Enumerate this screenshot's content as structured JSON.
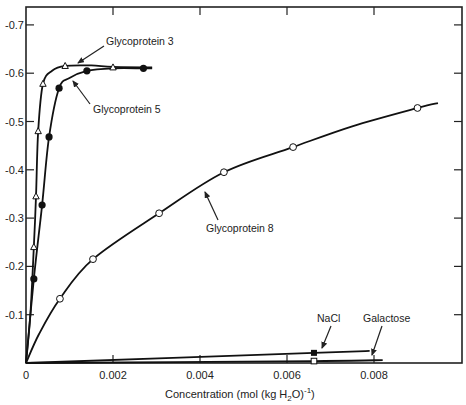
{
  "chart_data": {
    "type": "line",
    "title": "",
    "xlabel": "Concentration (mol (kg H2O)^-1)",
    "xlabel_parts": {
      "pre": "Concentration (mol (kg H",
      "sub": "2",
      "mid": "O)",
      "sup": "-1",
      "post": ")"
    },
    "ylabel": "",
    "xlim": [
      0,
      0.0099
    ],
    "ylim": [
      0,
      -0.74
    ],
    "x_ticks": [
      {
        "value": 0,
        "label": "0"
      },
      {
        "value": 0.002,
        "label": "0.002"
      },
      {
        "value": 0.004,
        "label": "0.004"
      },
      {
        "value": 0.006,
        "label": "0.006"
      },
      {
        "value": 0.008,
        "label": "0.008"
      }
    ],
    "y_ticks": [
      {
        "value": -0.1,
        "label": "-0.1"
      },
      {
        "value": -0.2,
        "label": "-0.2"
      },
      {
        "value": -0.3,
        "label": "-0.3"
      },
      {
        "value": -0.4,
        "label": "-0.4"
      },
      {
        "value": -0.5,
        "label": "-0.5"
      },
      {
        "value": -0.6,
        "label": "-0.6"
      },
      {
        "value": -0.7,
        "label": "-0.7"
      }
    ],
    "grid": false,
    "legend": "none (curves labeled with arrows)",
    "series": [
      {
        "name": "Glycoprotein 3",
        "marker": "open-triangle",
        "points": [
          [
            0.00018,
            -0.24
          ],
          [
            0.00023,
            -0.345
          ],
          [
            0.00028,
            -0.48
          ],
          [
            0.00039,
            -0.578
          ],
          [
            0.0009,
            -0.615
          ],
          [
            0.002,
            -0.612
          ]
        ],
        "curve": [
          [
            0,
            0
          ],
          [
            0.0001,
            -0.1
          ],
          [
            0.00018,
            -0.24
          ],
          [
            0.00023,
            -0.345
          ],
          [
            0.00028,
            -0.48
          ],
          [
            0.00039,
            -0.578
          ],
          [
            0.0006,
            -0.605
          ],
          [
            0.0009,
            -0.615
          ],
          [
            0.0015,
            -0.616
          ],
          [
            0.002,
            -0.613
          ],
          [
            0.0029,
            -0.612
          ]
        ]
      },
      {
        "name": "Glycoprotein 5",
        "marker": "filled-circle",
        "points": [
          [
            0.00018,
            -0.174
          ],
          [
            0.00037,
            -0.327
          ],
          [
            0.00053,
            -0.468
          ],
          [
            0.00076,
            -0.569
          ],
          [
            0.0014,
            -0.605
          ],
          [
            0.0027,
            -0.61
          ]
        ],
        "curve": [
          [
            0,
            0
          ],
          [
            0.00018,
            -0.174
          ],
          [
            0.00037,
            -0.327
          ],
          [
            0.00053,
            -0.468
          ],
          [
            0.00076,
            -0.569
          ],
          [
            0.001,
            -0.59
          ],
          [
            0.0014,
            -0.605
          ],
          [
            0.002,
            -0.61
          ],
          [
            0.0027,
            -0.61
          ],
          [
            0.0029,
            -0.61
          ]
        ]
      },
      {
        "name": "Glycoprotein 8",
        "marker": "open-circle",
        "points": [
          [
            0.00078,
            -0.133
          ],
          [
            0.00154,
            -0.215
          ],
          [
            0.00306,
            -0.31
          ],
          [
            0.00455,
            -0.395
          ],
          [
            0.00614,
            -0.447
          ],
          [
            0.009,
            -0.528
          ]
        ],
        "curve": [
          [
            0,
            0
          ],
          [
            0.0003,
            -0.06
          ],
          [
            0.00078,
            -0.133
          ],
          [
            0.00154,
            -0.215
          ],
          [
            0.00306,
            -0.31
          ],
          [
            0.00455,
            -0.395
          ],
          [
            0.00614,
            -0.447
          ],
          [
            0.0075,
            -0.49
          ],
          [
            0.009,
            -0.528
          ],
          [
            0.00947,
            -0.538
          ]
        ]
      },
      {
        "name": "NaCl",
        "marker": "filled-square",
        "points": [
          [
            0.00662,
            -0.021
          ]
        ],
        "curve": [
          [
            0,
            0
          ],
          [
            0.00662,
            -0.021
          ],
          [
            0.0079,
            -0.025
          ]
        ]
      },
      {
        "name": "Galactose",
        "marker": "open-square",
        "points": [
          [
            0.00662,
            -0.004
          ]
        ],
        "curve": [
          [
            0,
            0
          ],
          [
            0.00662,
            -0.004
          ],
          [
            0.0082,
            -0.006
          ]
        ]
      }
    ],
    "annotations": [
      {
        "text": "Glycoprotein 3",
        "series": "Glycoprotein 3"
      },
      {
        "text": "Glycoprotein 5",
        "series": "Glycoprotein 5"
      },
      {
        "text": "Glycoprotein 8",
        "series": "Glycoprotein 8"
      },
      {
        "text": "NaCl",
        "series": "NaCl"
      },
      {
        "text": "Galactose",
        "series": "Galactose"
      }
    ]
  }
}
